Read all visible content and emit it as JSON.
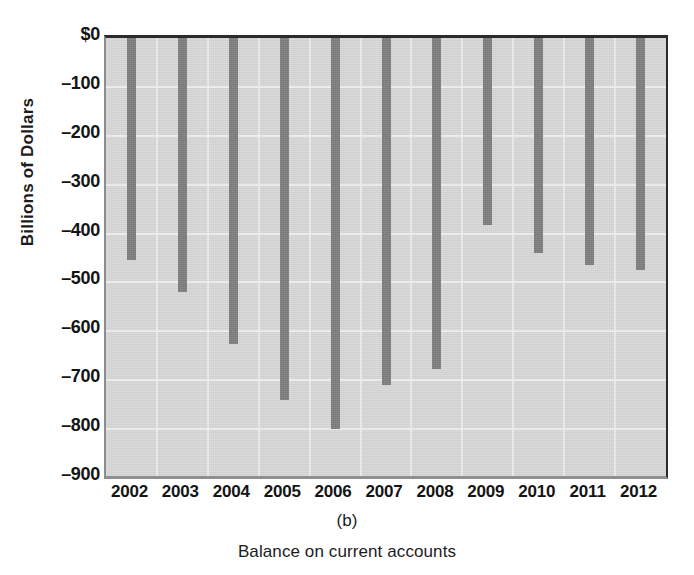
{
  "chart_data": {
    "type": "bar",
    "title": "",
    "subtitle": "",
    "panel_label": "(b)",
    "caption": "Balance on current accounts",
    "xlabel": "",
    "ylabel": "Billions of Dollars",
    "categories": [
      "2002",
      "2003",
      "2004",
      "2005",
      "2006",
      "2007",
      "2008",
      "2009",
      "2010",
      "2011",
      "2012"
    ],
    "values": [
      -455,
      -520,
      -625,
      -740,
      -800,
      -710,
      -677,
      -382,
      -440,
      -465,
      -475
    ],
    "series": [
      {
        "name": "Balance on current accounts",
        "values": [
          -455,
          -520,
          -625,
          -740,
          -800,
          -710,
          -677,
          -382,
          -440,
          -465,
          -475
        ]
      }
    ],
    "ylim": [
      -900,
      0
    ],
    "ytick_values": [
      0,
      -100,
      -200,
      -300,
      -400,
      -500,
      -600,
      -700,
      -800,
      -900
    ],
    "ytick_labels": [
      "$0",
      "–100",
      "–200",
      "–300",
      "–400",
      "–500",
      "–600",
      "–700",
      "–800",
      "–900"
    ],
    "grid": true,
    "grid_orientation": "both",
    "legend": null,
    "legend_position": "none",
    "bar_color": "#7d7d7d",
    "plot_background": "#d7d7d7",
    "axis_color": "#2b2b2b",
    "gridline_color": "#f1f1f1",
    "annotations": []
  },
  "axes": {
    "y_title": "Billions of Dollars"
  },
  "captions": {
    "panel": "(b)",
    "figure": "Balance on current accounts"
  }
}
